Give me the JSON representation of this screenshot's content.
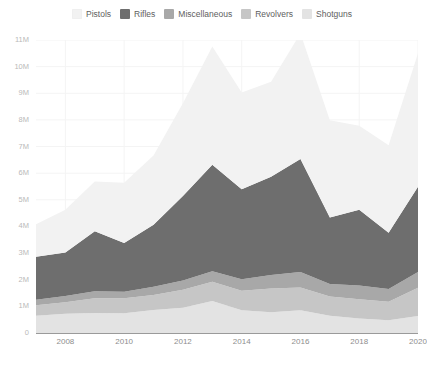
{
  "legend": {
    "position": "top-center",
    "items": [
      {
        "label": "Pistols",
        "color": "#f2f2f2"
      },
      {
        "label": "Rifles",
        "color": "#6e6e6e"
      },
      {
        "label": "Miscellaneous",
        "color": "#a8a8a8"
      },
      {
        "label": "Revolvers",
        "color": "#c6c6c6"
      },
      {
        "label": "Shotguns",
        "color": "#e3e3e3"
      }
    ]
  },
  "axes": {
    "y_ticks": [
      "0",
      "1M",
      "2M",
      "3M",
      "4M",
      "5M",
      "6M",
      "7M",
      "8M",
      "9M",
      "10M",
      "11M"
    ],
    "y_tick_values": [
      0,
      1,
      2,
      3,
      4,
      5,
      6,
      7,
      8,
      9,
      10,
      11
    ],
    "x_ticks": [
      "2008",
      "2010",
      "2012",
      "2014",
      "2016",
      "2018",
      "2020"
    ],
    "x_tick_values": [
      2008,
      2010,
      2012,
      2014,
      2016,
      2018,
      2020
    ],
    "grid": true,
    "grid_color": "#f4f4f4",
    "axis_line_color": "#9a9a9a"
  },
  "chart_data": {
    "type": "area",
    "stacked": true,
    "title": "",
    "xlabel": "",
    "ylabel": "",
    "xlim": [
      2007,
      2020
    ],
    "ylim": [
      0,
      11
    ],
    "units": "millions of firearms",
    "x": [
      2007,
      2008,
      2009,
      2010,
      2011,
      2012,
      2013,
      2014,
      2015,
      2016,
      2017,
      2018,
      2019,
      2020
    ],
    "categories": [
      "2007",
      "2008",
      "2009",
      "2010",
      "2011",
      "2012",
      "2013",
      "2014",
      "2015",
      "2016",
      "2017",
      "2018",
      "2019",
      "2020"
    ],
    "stack_order_bottom_to_top": [
      "Shotguns",
      "Revolvers",
      "Miscellaneous",
      "Rifles",
      "Pistols"
    ],
    "series": [
      {
        "name": "Shotguns",
        "color": "#e3e3e3",
        "values": [
          0.65,
          0.72,
          0.75,
          0.74,
          0.86,
          0.95,
          1.2,
          0.85,
          0.78,
          0.85,
          0.65,
          0.54,
          0.48,
          0.64
        ]
      },
      {
        "name": "Revolvers",
        "color": "#c6c6c6",
        "values": [
          0.39,
          0.43,
          0.55,
          0.56,
          0.57,
          0.67,
          0.72,
          0.74,
          0.89,
          0.86,
          0.72,
          0.73,
          0.69,
          1.06
        ]
      },
      {
        "name": "Miscellaneous",
        "color": "#a8a8a8",
        "values": [
          0.21,
          0.24,
          0.27,
          0.25,
          0.31,
          0.35,
          0.4,
          0.43,
          0.51,
          0.58,
          0.47,
          0.51,
          0.48,
          0.59
        ]
      },
      {
        "name": "Rifles",
        "color": "#6e6e6e",
        "values": [
          1.61,
          1.63,
          2.25,
          1.83,
          2.32,
          3.17,
          4.0,
          3.38,
          3.69,
          4.24,
          2.5,
          2.85,
          2.11,
          3.2
        ]
      },
      {
        "name": "Pistols",
        "color": "#f2f2f2",
        "values": [
          1.22,
          1.61,
          1.87,
          2.26,
          2.6,
          3.49,
          4.44,
          3.63,
          3.56,
          4.72,
          3.65,
          3.15,
          3.29,
          5.01
        ]
      }
    ],
    "totals": [
      4.08,
      4.63,
      5.69,
      5.64,
      6.66,
      8.63,
      10.76,
      9.03,
      9.43,
      11.25,
      7.99,
      7.78,
      7.05,
      10.5
    ]
  }
}
